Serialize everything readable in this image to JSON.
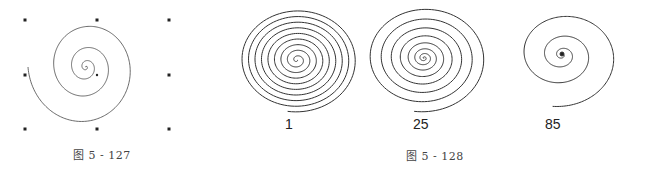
{
  "figures": [
    {
      "caption": "图 5 - 127",
      "description": "Spiral with selection handles"
    },
    {
      "caption": "图 5 - 128",
      "spirals": [
        {
          "label": "1"
        },
        {
          "label": "25"
        },
        {
          "label": "85"
        }
      ]
    }
  ]
}
